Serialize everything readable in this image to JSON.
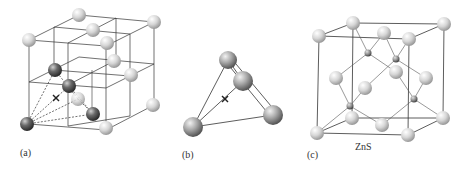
{
  "figure": {
    "panels": [
      {
        "label": "(a)",
        "caption": ""
      },
      {
        "label": "(b)",
        "caption": ""
      },
      {
        "label": "(c)",
        "caption": "ZnS"
      }
    ]
  },
  "colors": {
    "light_atom": "#d8d8d8",
    "dark_atom": "#5a5a5a",
    "line": "#333333",
    "background": "#ffffff"
  },
  "panel_a": {
    "light_atoms": [
      [
        79,
        15
      ],
      [
        154,
        22
      ],
      [
        93,
        30
      ],
      [
        29,
        40
      ],
      [
        107,
        43
      ],
      [
        114,
        61
      ],
      [
        131,
        75
      ],
      [
        153,
        105
      ],
      [
        106,
        128
      ]
    ],
    "shaded_atom": [
      78,
      99
    ],
    "dark_atoms": [
      [
        55,
        70
      ],
      [
        69,
        86
      ],
      [
        93,
        114
      ],
      [
        27,
        124
      ]
    ],
    "x_mark": [
      56,
      98
    ]
  },
  "panel_b": {
    "atoms": [
      [
        228,
        60
      ],
      [
        243,
        81
      ],
      [
        273,
        115
      ],
      [
        193,
        127
      ]
    ],
    "x_mark": [
      225,
      99
    ]
  },
  "panel_c": {
    "large_atoms": [
      [
        319,
        36
      ],
      [
        353,
        23
      ],
      [
        384,
        33
      ],
      [
        409,
        39
      ],
      [
        444,
        24
      ],
      [
        336,
        78
      ],
      [
        365,
        88
      ],
      [
        396,
        72
      ],
      [
        426,
        78
      ],
      [
        352,
        118
      ],
      [
        382,
        125
      ],
      [
        443,
        118
      ],
      [
        317,
        133
      ],
      [
        408,
        135
      ]
    ],
    "small_atoms": [
      [
        368,
        53
      ],
      [
        396,
        59
      ],
      [
        350,
        106
      ],
      [
        414,
        99
      ]
    ]
  }
}
